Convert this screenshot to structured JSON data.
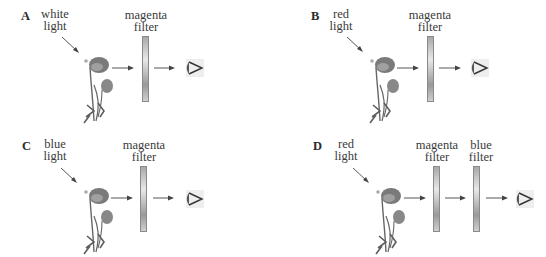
{
  "panels": [
    {
      "letter": "A",
      "light": [
        "white",
        "light"
      ],
      "filters": [
        [
          "magenta",
          "filter"
        ]
      ]
    },
    {
      "letter": "B",
      "light": [
        "red",
        "light"
      ],
      "filters": [
        [
          "magenta",
          "filter"
        ]
      ]
    },
    {
      "letter": "C",
      "light": [
        "blue",
        "light"
      ],
      "filters": [
        [
          "magenta",
          "filter"
        ]
      ]
    },
    {
      "letter": "D",
      "light": [
        "red",
        "light"
      ],
      "filters": [
        [
          "magenta",
          "filter"
        ],
        [
          "blue",
          "filter"
        ]
      ]
    }
  ],
  "icons": {
    "flower": "poppy-flower-icon",
    "eye": "eye-icon",
    "arrow": "arrow-right-icon"
  },
  "colors": {
    "flower_petal": "#7a7a7a",
    "stem": "#666666",
    "filter": "#b0b0b0",
    "text": "#333333"
  }
}
